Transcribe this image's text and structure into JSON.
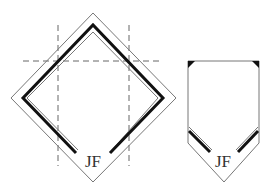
{
  "diagram": {
    "left_figure": {
      "name": "diamond-fold",
      "monogram": "JF"
    },
    "right_figure": {
      "name": "pentagon-fold",
      "monogram": "JF"
    },
    "colors": {
      "outline": "#777777",
      "stripe": "#111111",
      "dashed_guide": "#666666",
      "text": "#333333",
      "background": "#ffffff"
    }
  }
}
